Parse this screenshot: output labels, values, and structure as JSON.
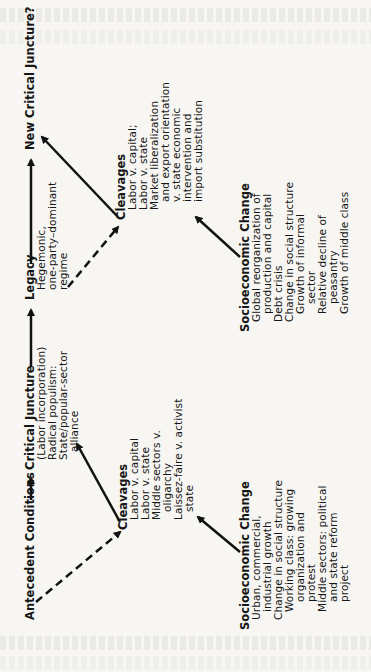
{
  "diagram": {
    "top_row": {
      "antecedent": "Antecedent Conditions",
      "critical_juncture": {
        "title": "Critical Juncture",
        "lines": [
          "(Labor incorporation)",
          "Radical populism:",
          "State/popular-sector",
          "alliance"
        ]
      },
      "legacy": {
        "title": "Legacy",
        "lines": [
          "Hegemonic,",
          "one-party–dominant",
          "regime"
        ]
      },
      "new_critical_juncture": "New Critical Juncture?"
    },
    "cleavages_early": {
      "title": "Cleavages",
      "lines": [
        "Labor v. capital",
        "Labor v. state",
        "Middle sectors v.",
        "oligarchy",
        "Laissez-faire v. activist",
        "state"
      ]
    },
    "cleavages_late": {
      "title": "Cleavages",
      "lines": [
        "Labor v. capital;",
        "Labor v. state",
        "Market liberalization",
        "and export orientation",
        "v. state economic",
        "intervention and",
        "import substitution"
      ]
    },
    "socio_early": {
      "title": "Socioeconomic Change",
      "lines": [
        "Urban, commercial,",
        "industrial growth",
        "Change in social structure",
        "Working class: growing",
        "organization and",
        "protest",
        "Middle sectors: political",
        "and state reform",
        "project"
      ]
    },
    "socio_late": {
      "title": "Socioeconomic Change",
      "lines": [
        "Global reorganization of",
        "production and capital",
        "Debt crisis",
        "Change in social structure",
        "Growth of informal",
        "sector",
        "Relative decline of",
        "peasantry",
        "Growth of middle class"
      ]
    },
    "arrows": [
      {
        "from": "antecedent",
        "to": "critical_juncture",
        "style": "solid"
      },
      {
        "from": "critical_juncture",
        "to": "legacy",
        "style": "solid"
      },
      {
        "from": "legacy",
        "to": "new_critical_juncture",
        "style": "solid"
      },
      {
        "from": "antecedent",
        "to": "cleavages_early",
        "style": "dashed"
      },
      {
        "from": "cleavages_early",
        "to": "critical_juncture",
        "style": "solid"
      },
      {
        "from": "socio_early",
        "to": "cleavages_early",
        "style": "solid"
      },
      {
        "from": "legacy",
        "to": "cleavages_late",
        "style": "dashed"
      },
      {
        "from": "cleavages_late",
        "to": "new_critical_juncture",
        "style": "solid"
      },
      {
        "from": "socio_late",
        "to": "cleavages_late",
        "style": "solid"
      }
    ]
  }
}
